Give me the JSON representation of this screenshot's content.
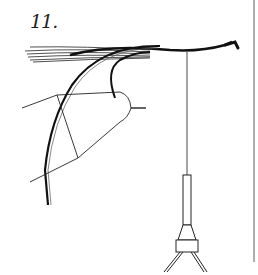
{
  "figure": {
    "label": "11.",
    "ink_color": "#1a1a1a"
  }
}
